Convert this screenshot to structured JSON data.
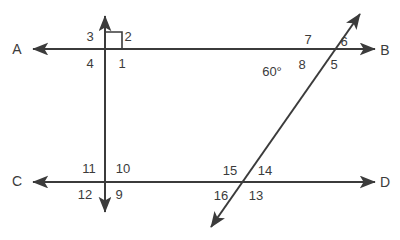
{
  "figure": {
    "stroke_color": "#3b3b3b",
    "text_color": "#3b3b3b",
    "background_color": "#ffffff",
    "line_width": 2,
    "point_labels": [
      {
        "id": "A",
        "text": "A",
        "x": 17,
        "y": 49
      },
      {
        "id": "B",
        "text": "B",
        "x": 385,
        "y": 50
      },
      {
        "id": "C",
        "text": "C",
        "x": 17,
        "y": 181
      },
      {
        "id": "D",
        "text": "D",
        "x": 385,
        "y": 182
      }
    ],
    "angle_labels": [
      {
        "id": "1",
        "text": "1",
        "x": 122,
        "y": 63
      },
      {
        "id": "2",
        "text": "2",
        "x": 128,
        "y": 36
      },
      {
        "id": "3",
        "text": "3",
        "x": 90,
        "y": 36
      },
      {
        "id": "4",
        "text": "4",
        "x": 90,
        "y": 63
      },
      {
        "id": "5",
        "text": "5",
        "x": 334,
        "y": 64
      },
      {
        "id": "6",
        "text": "6",
        "x": 344,
        "y": 41
      },
      {
        "id": "7",
        "text": "7",
        "x": 308,
        "y": 39
      },
      {
        "id": "8",
        "text": "8",
        "x": 302,
        "y": 64
      },
      {
        "id": "9",
        "text": "9",
        "x": 119,
        "y": 194
      },
      {
        "id": "10",
        "text": "10",
        "x": 123,
        "y": 168
      },
      {
        "id": "11",
        "text": "11",
        "x": 89,
        "y": 168
      },
      {
        "id": "12",
        "text": "12",
        "x": 85,
        "y": 194
      },
      {
        "id": "13",
        "text": "13",
        "x": 256,
        "y": 195
      },
      {
        "id": "14",
        "text": "14",
        "x": 265,
        "y": 170
      },
      {
        "id": "15",
        "text": "15",
        "x": 230,
        "y": 170
      },
      {
        "id": "16",
        "text": "16",
        "x": 221,
        "y": 195
      }
    ],
    "measure_labels": [
      {
        "id": "angle-60",
        "text": "60°",
        "x": 272,
        "y": 71
      }
    ],
    "lines": [
      {
        "id": "line-AB",
        "label": "A to B horizontal line",
        "x1": 33,
        "y1": 49,
        "x2": 375,
        "y2": 49,
        "arrow_start": true,
        "arrow_end": true
      },
      {
        "id": "line-CD",
        "label": "C to D horizontal line",
        "x1": 33,
        "y1": 182,
        "x2": 375,
        "y2": 182,
        "arrow_start": true,
        "arrow_end": true
      },
      {
        "id": "line-vertical",
        "label": "vertical perpendicular line",
        "x1": 105,
        "y1": 14,
        "x2": 105,
        "y2": 214,
        "arrow_start": true,
        "arrow_end": true
      },
      {
        "id": "line-transversal",
        "label": "slanted transversal line",
        "x1": 362,
        "y1": 11,
        "x2": 209,
        "y2": 230,
        "arrow_start": true,
        "arrow_end": true
      }
    ],
    "right_angle_mark": {
      "id": "right-angle-mark",
      "label": "right angle square at angle 2",
      "x": 105,
      "y": 49,
      "size": 17
    }
  }
}
